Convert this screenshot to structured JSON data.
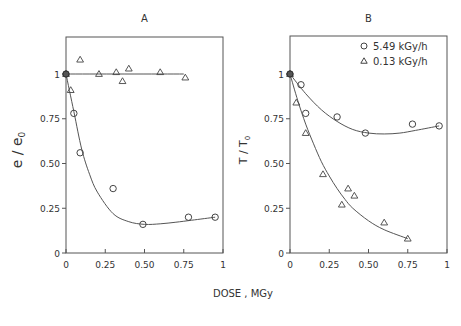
{
  "figure": {
    "xlabel": "DOSE , MGy",
    "legend": [
      {
        "marker": "circle",
        "label": "5.49 kGy/h"
      },
      {
        "marker": "triangle",
        "label": "0.13 kGy/h"
      }
    ]
  },
  "chart_data": [
    {
      "type": "scatter",
      "title": "A",
      "xlabel": "DOSE , MGy",
      "ylabel": "e / e0",
      "xlim": [
        0,
        1
      ],
      "ylim": [
        0,
        1.2
      ],
      "xticks": [
        "0",
        "0.25",
        "0.50",
        "0.75",
        "1"
      ],
      "yticks": [
        "0",
        "0.25",
        "0.50",
        "0.75",
        "1"
      ],
      "grid": false,
      "series": [
        {
          "name": "5.49 kGy/h",
          "marker": "circle",
          "x": [
            0,
            0.05,
            0.09,
            0.3,
            0.49,
            0.78,
            0.95
          ],
          "y": [
            1.0,
            0.78,
            0.56,
            0.36,
            0.16,
            0.2,
            0.2
          ],
          "fit": {
            "x": [
              0,
              0.05,
              0.1,
              0.15,
              0.2,
              0.3,
              0.4,
              0.5,
              0.6,
              0.7,
              0.8,
              0.95
            ],
            "y": [
              1.0,
              0.79,
              0.58,
              0.44,
              0.34,
              0.22,
              0.175,
              0.16,
              0.163,
              0.172,
              0.183,
              0.2
            ]
          }
        },
        {
          "name": "0.13 kGy/h",
          "marker": "triangle",
          "x": [
            0,
            0.03,
            0.09,
            0.21,
            0.32,
            0.36,
            0.4,
            0.6,
            0.76
          ],
          "y": [
            1.0,
            0.91,
            1.08,
            1.0,
            1.01,
            0.96,
            1.03,
            1.01,
            0.98
          ],
          "fit": {
            "x": [
              0,
              0.75
            ],
            "y": [
              1.0,
              1.0
            ]
          }
        }
      ]
    },
    {
      "type": "scatter",
      "title": "B",
      "xlabel": "DOSE , MGy",
      "ylabel": "T / T0",
      "xlim": [
        0,
        1
      ],
      "ylim": [
        0,
        1.2
      ],
      "xticks": [
        "0",
        "0.25",
        "0.50",
        "0.75",
        "1"
      ],
      "yticks": [
        "0",
        "0.25",
        "0.50",
        "0.75",
        "1"
      ],
      "grid": false,
      "legend_position": "upper right",
      "series": [
        {
          "name": "5.49 kGy/h",
          "marker": "circle",
          "x": [
            0,
            0.07,
            0.1,
            0.3,
            0.48,
            0.78,
            0.95
          ],
          "y": [
            1.0,
            0.94,
            0.78,
            0.76,
            0.67,
            0.72,
            0.71
          ],
          "fit": {
            "x": [
              0,
              0.1,
              0.2,
              0.3,
              0.4,
              0.5,
              0.6,
              0.7,
              0.8,
              0.95
            ],
            "y": [
              1.0,
              0.89,
              0.8,
              0.735,
              0.69,
              0.67,
              0.665,
              0.67,
              0.685,
              0.71
            ]
          }
        },
        {
          "name": "0.13 kGy/h",
          "marker": "triangle",
          "x": [
            0,
            0.04,
            0.1,
            0.21,
            0.33,
            0.37,
            0.41,
            0.6,
            0.75
          ],
          "y": [
            1.0,
            0.84,
            0.67,
            0.44,
            0.27,
            0.36,
            0.32,
            0.17,
            0.08
          ],
          "fit": {
            "x": [
              0,
              0.05,
              0.1,
              0.15,
              0.2,
              0.25,
              0.3,
              0.35,
              0.4,
              0.5,
              0.6,
              0.75
            ],
            "y": [
              1.0,
              0.85,
              0.72,
              0.61,
              0.51,
              0.43,
              0.36,
              0.3,
              0.25,
              0.18,
              0.13,
              0.08
            ]
          }
        }
      ]
    }
  ]
}
